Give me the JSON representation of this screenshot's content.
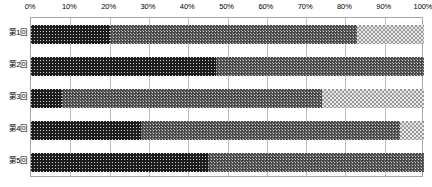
{
  "chart_data": {
    "type": "bar",
    "orientation": "horizontal",
    "stacked": true,
    "normalized": true,
    "title": "",
    "subtitle": "",
    "xlabel": "",
    "ylabel": "",
    "xlim": [
      0,
      100
    ],
    "grid": true,
    "legend": "none",
    "categories": [
      "第1回",
      "第2回",
      "第3回",
      "第4回",
      "第5回"
    ],
    "tick_labels": [
      "0%",
      "10%",
      "20%",
      "30%",
      "40%",
      "50%",
      "60%",
      "70%",
      "80%",
      "90%",
      "100%"
    ],
    "tick_values": [
      0,
      10,
      20,
      30,
      40,
      50,
      60,
      70,
      80,
      90,
      100
    ],
    "series": [
      {
        "name": "series-1",
        "pattern": "dark-dotted",
        "color": "#1d1d1d",
        "values": [
          20,
          47,
          8,
          28,
          45
        ]
      },
      {
        "name": "series-2",
        "pattern": "medium-dotted",
        "color": "#4a4a4a",
        "values": [
          63,
          53,
          66,
          66,
          55
        ]
      },
      {
        "name": "series-3",
        "pattern": "light-checker",
        "color": "#e8e8e8",
        "values": [
          17,
          0,
          26,
          6,
          0
        ]
      }
    ],
    "colors": {
      "axis_line": "#a6a6a6",
      "gridline": "#bfbfbf",
      "text": "#000000",
      "background": "#ffffff"
    }
  }
}
